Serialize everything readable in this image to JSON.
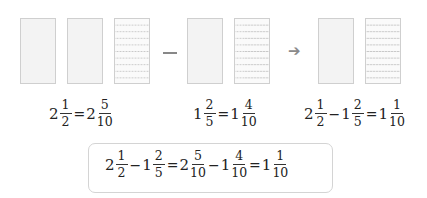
{
  "diagram": {
    "groups": [
      {
        "id": "minuend",
        "boxes": [
          "plain",
          "plain",
          "lined-10"
        ]
      },
      {
        "id": "subtrahend",
        "boxes": [
          "plain",
          "lined-10"
        ]
      },
      {
        "id": "difference",
        "boxes": [
          "plain",
          "lined-10"
        ]
      }
    ],
    "operator": "−",
    "arrow": "➔",
    "colors": {
      "box_fill": "#f3f3f3",
      "box_border": "#cfcfcf",
      "line": "#c9c9c9",
      "text": "#222222"
    }
  },
  "equations": {
    "eq1": {
      "w1": "2",
      "n1": "1",
      "d1": "2",
      "eq": "=",
      "w2": "2",
      "n2": "5",
      "d2": "10"
    },
    "eq2": {
      "w1": "1",
      "n1": "2",
      "d1": "5",
      "eq": "=",
      "w2": "1",
      "n2": "4",
      "d2": "10"
    },
    "eq3": {
      "w1": "2",
      "n1": "1",
      "d1": "2",
      "op": "−",
      "w2": "1",
      "n2": "2",
      "d2": "5",
      "eq": "=",
      "w3": "1",
      "n3": "1",
      "d3": "10"
    },
    "summary": {
      "w1": "2",
      "n1": "1",
      "d1": "2",
      "op1": "−",
      "w2": "1",
      "n2": "2",
      "d2": "5",
      "eq1": "=",
      "w3": "2",
      "n3": "5",
      "d3": "10",
      "op2": "−",
      "w4": "1",
      "n4": "4",
      "d4": "10",
      "eq2": "=",
      "w5": "1",
      "n5": "1",
      "d5": "10"
    }
  }
}
